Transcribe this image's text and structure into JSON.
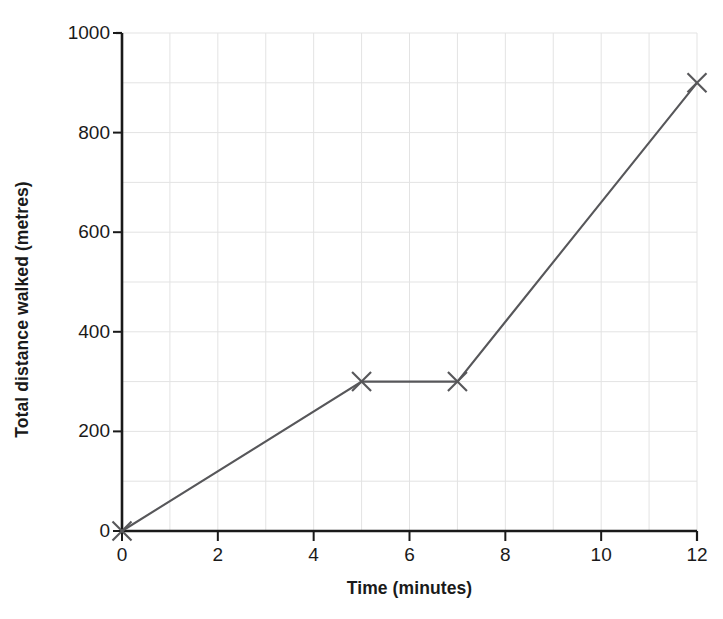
{
  "chart_data": {
    "type": "line",
    "title": "",
    "xlabel": "Time (minutes)",
    "ylabel": "Total distance walked (metres)",
    "xlim": [
      0,
      12
    ],
    "ylim": [
      0,
      1000
    ],
    "xticks": [
      0,
      2,
      4,
      6,
      8,
      10,
      12
    ],
    "xtick_labels": [
      "0",
      "2",
      "4",
      "6",
      "8",
      "10",
      "12"
    ],
    "yticks": [
      0,
      200,
      400,
      600,
      800,
      1000
    ],
    "ytick_labels": [
      "0",
      "200",
      "400",
      "600",
      "800",
      "1000"
    ],
    "grid": true,
    "grid_x_step": 1,
    "grid_y_step": 100,
    "grid_color": "#e3e3e3",
    "axis_color": "#1a1a1a",
    "legend": "none",
    "series": [
      {
        "name": "Total distance walked",
        "marker": "x",
        "color": "#57575a",
        "x": [
          0,
          5,
          7,
          12
        ],
        "values": [
          0,
          300,
          300,
          900
        ],
        "points": [
          {
            "x": 0,
            "y": 0
          },
          {
            "x": 5,
            "y": 300
          },
          {
            "x": 7,
            "y": 300
          },
          {
            "x": 12,
            "y": 900
          }
        ]
      }
    ],
    "annotations": []
  },
  "figure": {
    "cropped_caption": "",
    "y_axis_title": "Total distance walked (metres)",
    "x_axis_title": "Time (minutes)"
  }
}
